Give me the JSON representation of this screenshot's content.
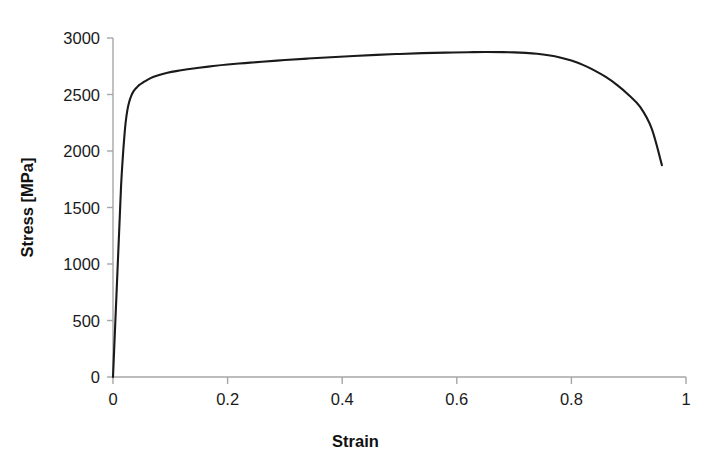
{
  "chart_data": {
    "type": "line",
    "title": "",
    "subtitle": "",
    "xlabel": "Strain",
    "ylabel": "Stress [MPa]",
    "xlim": [
      0,
      1
    ],
    "ylim": [
      0,
      3000
    ],
    "xticks": [
      "0",
      "0.2",
      "0.4",
      "0.6",
      "0.8",
      "1"
    ],
    "xtick_values": [
      0,
      0.2,
      0.4,
      0.6,
      0.8,
      1
    ],
    "yticks": [
      "0",
      "500",
      "1000",
      "1500",
      "2000",
      "2500",
      "3000"
    ],
    "ytick_values": [
      0,
      500,
      1000,
      1500,
      2000,
      2500,
      3000
    ],
    "grid": false,
    "legend": null,
    "legend_position": "none",
    "line_color": "#1a1a1a",
    "line_width": 2.1,
    "background_color": "#ffffff",
    "axis_color": "#a6a6a6",
    "series": [
      {
        "name": "Stress-strain curve",
        "x": [
          0.0,
          0.002,
          0.004,
          0.006,
          0.008,
          0.01,
          0.012,
          0.014,
          0.016,
          0.018,
          0.02,
          0.022,
          0.025,
          0.028,
          0.032,
          0.036,
          0.041,
          0.046,
          0.052,
          0.06,
          0.07,
          0.082,
          0.095,
          0.11,
          0.13,
          0.15,
          0.175,
          0.2,
          0.23,
          0.26,
          0.3,
          0.34,
          0.38,
          0.42,
          0.46,
          0.5,
          0.54,
          0.58,
          0.62,
          0.65,
          0.68,
          0.7,
          0.72,
          0.74,
          0.76,
          0.78,
          0.8,
          0.82,
          0.84,
          0.86,
          0.88,
          0.9,
          0.92,
          0.94,
          0.958
        ],
        "y": [
          0,
          240,
          480,
          720,
          960,
          1200,
          1440,
          1680,
          1860,
          2010,
          2140,
          2250,
          2360,
          2430,
          2490,
          2530,
          2560,
          2585,
          2605,
          2630,
          2655,
          2675,
          2692,
          2707,
          2723,
          2737,
          2752,
          2765,
          2778,
          2790,
          2805,
          2818,
          2830,
          2841,
          2851,
          2859,
          2866,
          2871,
          2874,
          2876,
          2875,
          2873,
          2868,
          2860,
          2847,
          2828,
          2800,
          2762,
          2714,
          2655,
          2583,
          2496,
          2390,
          2200,
          1875
        ]
      }
    ]
  },
  "axes": {
    "origin_px": {
      "x": 113,
      "y": 377
    },
    "x_end_px": 686,
    "y_top_px": 38
  }
}
